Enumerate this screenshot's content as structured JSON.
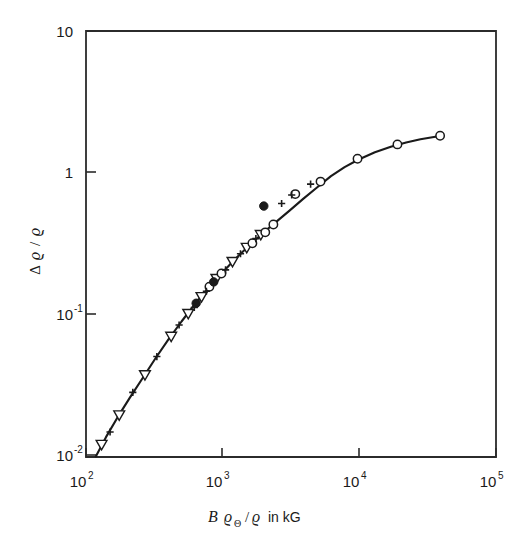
{
  "figure": {
    "background_color": "#ffffff",
    "foreground_color": "#1a1a1a",
    "width": 532,
    "height": 552
  },
  "chart_data": {
    "type": "line",
    "title": "",
    "subtitle": "",
    "xlabel": "B ϱΘ/ϱ in kG",
    "xlabel_parts": {
      "symbol_b": "B",
      "symbol_rho": "ϱ",
      "subscript_theta": "Θ",
      "divider": "/",
      "symbol_rho_2": "ϱ",
      "units_text": "in kG"
    },
    "ylabel": "Δϱ/ϱ",
    "ylabel_parts": {
      "delta": "Δ",
      "symbol_rho": "ϱ",
      "divider": "/",
      "symbol_rho_2": "ϱ"
    },
    "xscale": "log",
    "yscale": "log",
    "xlim": [
      100,
      100000
    ],
    "ylim": [
      0.01,
      10
    ],
    "grid": false,
    "legend": "none",
    "xticks": [
      {
        "value": 100,
        "label": "10",
        "exponent": "2"
      },
      {
        "value": 1000,
        "label": "10",
        "exponent": "3"
      },
      {
        "value": 10000,
        "label": "10",
        "exponent": "4"
      },
      {
        "value": 100000,
        "label": "10",
        "exponent": "5"
      }
    ],
    "yticks": [
      {
        "value": 10,
        "label": "10",
        "exponent": ""
      },
      {
        "value": 1,
        "label": "1",
        "exponent": ""
      },
      {
        "value": 0.1,
        "label": "10",
        "exponent": "-1"
      },
      {
        "value": 0.01,
        "label": "10",
        "exponent": "-2"
      }
    ],
    "curve": {
      "name": "magnetoresistance-master-curve",
      "x": [
        118,
        140,
        170,
        210,
        260,
        320,
        400,
        500,
        620,
        780,
        980,
        1230,
        1550,
        1950,
        2450,
        3100,
        3900,
        4900,
        6200,
        7800,
        9800,
        13000,
        17000,
        22000,
        28000,
        36000,
        41000
      ],
      "y": [
        0.0101,
        0.0138,
        0.019,
        0.0263,
        0.036,
        0.049,
        0.067,
        0.09,
        0.118,
        0.153,
        0.196,
        0.247,
        0.306,
        0.375,
        0.451,
        0.545,
        0.66,
        0.79,
        0.95,
        1.1,
        1.24,
        1.4,
        1.53,
        1.64,
        1.73,
        1.8,
        1.84
      ]
    },
    "series": [
      {
        "name": "open-triangle-series",
        "marker": "open-triangle-down",
        "points": [
          {
            "x": 130,
            "y": 0.0122
          },
          {
            "x": 175,
            "y": 0.0197
          },
          {
            "x": 270,
            "y": 0.0378
          },
          {
            "x": 420,
            "y": 0.0705
          },
          {
            "x": 560,
            "y": 0.102
          },
          {
            "x": 700,
            "y": 0.134
          },
          {
            "x": 900,
            "y": 0.18
          },
          {
            "x": 1180,
            "y": 0.237
          },
          {
            "x": 1500,
            "y": 0.298
          },
          {
            "x": 1900,
            "y": 0.367
          }
        ]
      },
      {
        "name": "open-circle-series",
        "marker": "open-circle",
        "points": [
          {
            "x": 800,
            "y": 0.158
          },
          {
            "x": 980,
            "y": 0.196
          },
          {
            "x": 1650,
            "y": 0.32
          },
          {
            "x": 2050,
            "y": 0.382
          },
          {
            "x": 2350,
            "y": 0.434
          },
          {
            "x": 3400,
            "y": 0.71
          },
          {
            "x": 5200,
            "y": 0.87
          },
          {
            "x": 9700,
            "y": 1.26
          },
          {
            "x": 19000,
            "y": 1.59
          },
          {
            "x": 39000,
            "y": 1.83
          }
        ]
      },
      {
        "name": "filled-circle-series",
        "marker": "filled-circle",
        "points": [
          {
            "x": 640,
            "y": 0.121
          },
          {
            "x": 860,
            "y": 0.171
          },
          {
            "x": 2000,
            "y": 0.585
          }
        ]
      },
      {
        "name": "plus-cross-series",
        "marker": "plus",
        "points": [
          {
            "x": 150,
            "y": 0.015
          },
          {
            "x": 220,
            "y": 0.0285
          },
          {
            "x": 330,
            "y": 0.051
          },
          {
            "x": 480,
            "y": 0.085
          },
          {
            "x": 620,
            "y": 0.113
          },
          {
            "x": 760,
            "y": 0.147
          },
          {
            "x": 1050,
            "y": 0.208
          },
          {
            "x": 1350,
            "y": 0.27
          },
          {
            "x": 1750,
            "y": 0.345
          },
          {
            "x": 2700,
            "y": 0.61
          },
          {
            "x": 3200,
            "y": 0.7
          },
          {
            "x": 4400,
            "y": 0.835
          }
        ]
      }
    ]
  }
}
